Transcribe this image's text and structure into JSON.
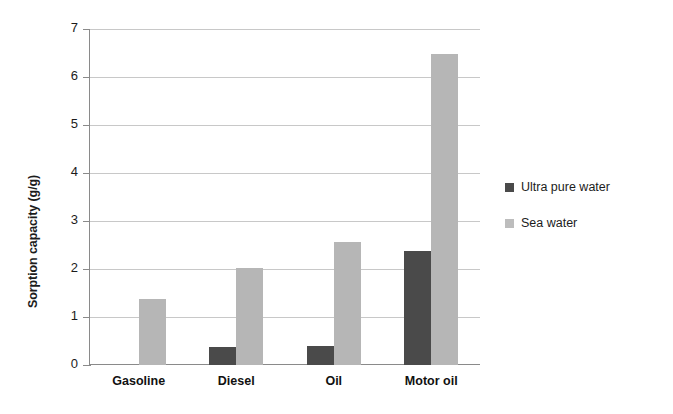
{
  "chart_data": {
    "type": "bar",
    "title": "",
    "subtitle": "",
    "xlabel": "",
    "ylabel": "Sorption capacity (g/g)",
    "categories": [
      "Gasoline",
      "Diesel",
      "Oil",
      "Motor oil"
    ],
    "series": [
      {
        "name": "Ultra pure water",
        "color": "#4a4a4a",
        "values": [
          0,
          0.38,
          0.39,
          2.37
        ]
      },
      {
        "name": "Sea water",
        "color": "#b6b6b6",
        "values": [
          1.38,
          2.03,
          2.57,
          6.48
        ]
      }
    ],
    "ylim": [
      0,
      7
    ],
    "yticks": [
      0,
      1,
      2,
      3,
      4,
      5,
      6,
      7
    ],
    "ytick_labels": [
      "0",
      "1",
      "2",
      "3",
      "4",
      "5",
      "6",
      "7"
    ],
    "grid": "horizontal",
    "legend_position": "right",
    "annotations": []
  },
  "axis": {
    "y_title": "Sorption capacity (g/g)"
  },
  "legend": {
    "entries": [
      {
        "label": "Ultra pure water",
        "swatch": "legend-swatch-dark"
      },
      {
        "label": "Sea water",
        "swatch": "legend-swatch-light"
      }
    ]
  }
}
